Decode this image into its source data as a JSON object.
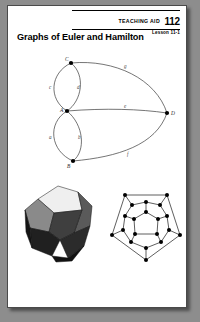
{
  "header": {
    "aid_label": "TEACHING AID",
    "aid_number": "112",
    "lesson": "Lesson 11-1"
  },
  "title": "Graphs of Euler and Hamilton",
  "figures": {
    "euler_graph": {
      "name": "euler-multigraph",
      "vertices": [
        {
          "id": "A",
          "label": "A",
          "cx": 47,
          "cy": 58,
          "label_dx": -7,
          "label_dy": 1
        },
        {
          "id": "B",
          "label": "B",
          "cx": 53,
          "cy": 108,
          "label_dx": -6,
          "label_dy": 7
        },
        {
          "id": "C",
          "label": "C",
          "cx": 51,
          "cy": 10,
          "label_dx": -6,
          "label_dy": -2
        },
        {
          "id": "D",
          "label": "D",
          "cx": 147,
          "cy": 60,
          "label_dx": 4,
          "label_dy": 2
        }
      ],
      "edges": [
        {
          "id": "a",
          "label": "a",
          "from": "A",
          "to": "B",
          "side": "left",
          "lx": 29,
          "ly": 86
        },
        {
          "id": "b",
          "label": "b",
          "from": "A",
          "to": "B",
          "side": "right",
          "lx": 58,
          "ly": 86
        },
        {
          "id": "c",
          "label": "c",
          "from": "A",
          "to": "C",
          "side": "left",
          "lx": 29,
          "ly": 36
        },
        {
          "id": "d",
          "label": "d",
          "from": "A",
          "to": "C",
          "side": "right",
          "lx": 57,
          "ly": 36
        },
        {
          "id": "e",
          "label": "e",
          "from": "A",
          "to": "D",
          "side": "middle",
          "lx": 104,
          "ly": 55
        },
        {
          "id": "g",
          "label": "g",
          "from": "C",
          "to": "D",
          "side": "upper",
          "lx": 104,
          "ly": 15
        },
        {
          "id": "f",
          "label": "f",
          "from": "B",
          "to": "D",
          "side": "lower",
          "lx": 107,
          "ly": 103
        }
      ]
    },
    "dodecahedron": {
      "name": "dodecahedron-solid"
    },
    "hamilton_graph": {
      "name": "dodecahedral-planar-graph"
    }
  }
}
